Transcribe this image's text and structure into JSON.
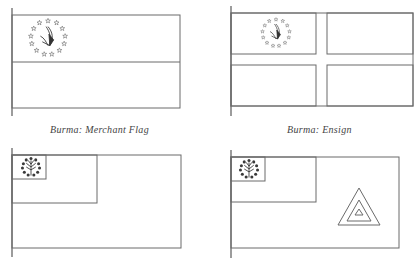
{
  "figures": [
    {
      "id": "merchant-flag",
      "caption": "Burma: Merchant Flag",
      "emblem": "star-ring-peacock-emblem",
      "layout": "horizontal-bicolour"
    },
    {
      "id": "ensign",
      "caption": "Burma: Ensign",
      "emblem": "star-ring-peacock-emblem",
      "layout": "nordic-cross"
    },
    {
      "id": "jack-canton-flag",
      "caption": "",
      "emblem": "star-ring-tree-emblem",
      "layout": "canton-with-inner-canton"
    },
    {
      "id": "triangle-flag",
      "caption": "",
      "emblem": "star-ring-tree-emblem",
      "layout": "canton-with-concentric-triangles"
    }
  ],
  "colors": {
    "line": "#6a6a6a",
    "emblem": "#3a3a3a",
    "caption": "#444444",
    "background": "#ffffff"
  }
}
